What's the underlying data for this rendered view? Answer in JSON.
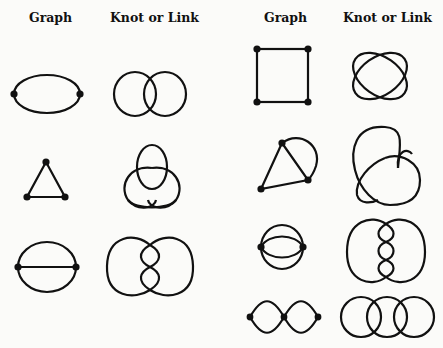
{
  "headers": {
    "left_graph": "Graph",
    "left_knot": "Knot or Link",
    "right_graph": "Graph",
    "right_knot": "Knot or Link"
  },
  "colors": {
    "ink": "#111111",
    "paper": "#fbfbf9"
  },
  "rows_left": [
    {
      "graph": "two-vertex graph with two parallel edges",
      "knot": "Hopf link (two linked circles)"
    },
    {
      "graph": "triangle (3-cycle)",
      "knot": "trefoil knot"
    },
    {
      "graph": "theta graph (two vertices, three edges)",
      "knot": "two-lobed knot with twisted center"
    }
  ],
  "rows_right": [
    {
      "graph": "square (4-cycle)",
      "knot": "two interlaced loops (4 crossings)"
    },
    {
      "graph": "triangle with extra arc edge",
      "knot": "figure-eight style knot"
    },
    {
      "graph": "two vertices with four parallel edges",
      "knot": "two-lobed knot with three twists"
    },
    {
      "graph": "chain of two digons (three vertices)",
      "knot": "chain of three linked circles"
    }
  ]
}
